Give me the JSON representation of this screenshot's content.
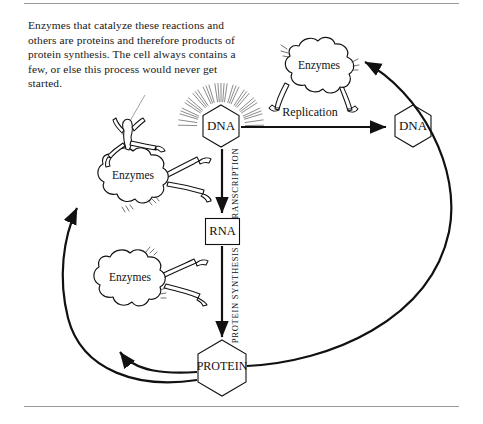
{
  "document": {
    "caption": "Enzymes that catalyze these reactions and others are proteins and therefore products of protein synthesis. The cell always contains a few, or else this process would never get started."
  },
  "diagram": {
    "nodes": {
      "dna_left": "DNA",
      "dna_right": "DNA",
      "rna": "RNA",
      "protein": "PROTEIN"
    },
    "process_labels": {
      "transcription": "TRANSCRIPTION",
      "protein_synthesis": "PROTEIN SYNTHESIS",
      "replication": "Replication"
    },
    "enzyme_blobs": [
      {
        "id": "enzymes-top-right",
        "label": "Enzymes"
      },
      {
        "id": "enzymes-mid-left",
        "label": "Enzymes"
      },
      {
        "id": "enzymes-lower-left",
        "label": "Enzymes"
      }
    ],
    "colors": {
      "ink": "#111111",
      "rule": "#9a9a9a",
      "background": "#ffffff"
    }
  }
}
